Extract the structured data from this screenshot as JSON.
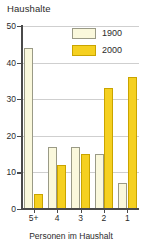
{
  "chart_data": {
    "type": "bar",
    "title": "Haushalte",
    "xlabel": "Personen im Haushalt",
    "ylabel": "",
    "categories": [
      "5+",
      "4",
      "3",
      "2",
      "1"
    ],
    "series": [
      {
        "name": "1900",
        "color": "#faf8dc",
        "values": [
          44,
          17,
          17,
          15,
          7
        ]
      },
      {
        "name": "2000",
        "color": "#f5d020",
        "values": [
          4,
          12,
          15,
          33,
          36
        ]
      }
    ],
    "ylim": [
      0,
      50
    ],
    "yticks": [
      0,
      10,
      20,
      30,
      40,
      50
    ],
    "ytick_labels": [
      "0",
      "10",
      "20",
      "30",
      "40",
      "50"
    ],
    "grid": true,
    "legend_position": "top-right"
  },
  "legend": {
    "entries": [
      {
        "label": "1900"
      },
      {
        "label": "2000"
      }
    ]
  }
}
